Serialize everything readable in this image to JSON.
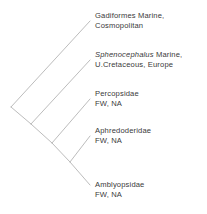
{
  "figure": {
    "type": "cladogram",
    "taxa_count": 5,
    "line_color": "#b4b4b4",
    "text_color": "#3a3a3a",
    "background_color": "#ffffff"
  },
  "taxa": [
    {
      "id": "gadiformes",
      "name": "Gadiformes",
      "name_style": "roman",
      "habitat": "Marine,",
      "line1": "Gadiformes  Marine,",
      "line2": "Cosmopolitan",
      "tip_x": 90,
      "tip_y": 21,
      "label_x": 95,
      "label_y": 11
    },
    {
      "id": "sphenocephalus",
      "name": "Sphenocephalus",
      "name_style": "italic",
      "habitat": "Marine,",
      "line1_italic": "Sphenocephalus",
      "line1_rest": " Marine,",
      "line2": "U.Cretaceous, Europe",
      "tip_x": 90,
      "tip_y": 60,
      "label_x": 95,
      "label_y": 50
    },
    {
      "id": "percopsidae",
      "name": "Percopsidae",
      "name_style": "roman",
      "habitat": "FW, NA",
      "line1": "Percopsidae",
      "line2": "FW, NA",
      "tip_x": 90,
      "tip_y": 99,
      "label_x": 95,
      "label_y": 89
    },
    {
      "id": "aphredoderidae",
      "name": "Aphredoderidae",
      "name_style": "roman",
      "habitat": "FW, NA",
      "line1": "Aphredoderidae",
      "line2": "FW, NA",
      "tip_x": 90,
      "tip_y": 136,
      "label_x": 95,
      "label_y": 126
    },
    {
      "id": "amblyopsidae",
      "name": "Amblyopsidae",
      "name_style": "roman",
      "habitat": "FW, NA",
      "line1": "Amblyopsidae",
      "line2": "FW, NA",
      "tip_x": 90,
      "tip_y": 185,
      "label_x": 95,
      "label_y": 180
    }
  ],
  "nodes": [
    {
      "id": "root",
      "x": 11,
      "y": 107
    },
    {
      "id": "node2",
      "x": 31,
      "y": 124
    },
    {
      "id": "node3",
      "x": 52,
      "y": 143
    },
    {
      "id": "node4",
      "x": 70,
      "y": 162
    }
  ],
  "branches": [
    {
      "id": "branch-root-to-gadiformes",
      "x1": 11,
      "y1": 107,
      "x2": 90,
      "y2": 21
    },
    {
      "id": "branch-root-to-node2",
      "x1": 11,
      "y1": 107,
      "x2": 31,
      "y2": 124
    },
    {
      "id": "branch-node2-to-sphenocephalus",
      "x1": 31,
      "y1": 124,
      "x2": 90,
      "y2": 60
    },
    {
      "id": "branch-node2-to-node3",
      "x1": 31,
      "y1": 124,
      "x2": 52,
      "y2": 143
    },
    {
      "id": "branch-node3-to-percopsidae",
      "x1": 52,
      "y1": 143,
      "x2": 90,
      "y2": 99
    },
    {
      "id": "branch-node3-to-node4",
      "x1": 52,
      "y1": 143,
      "x2": 70,
      "y2": 162
    },
    {
      "id": "branch-node4-to-aphredoderidae",
      "x1": 70,
      "y1": 162,
      "x2": 90,
      "y2": 136
    },
    {
      "id": "branch-node4-to-amblyopsidae",
      "x1": 70,
      "y1": 162,
      "x2": 90,
      "y2": 185
    }
  ]
}
